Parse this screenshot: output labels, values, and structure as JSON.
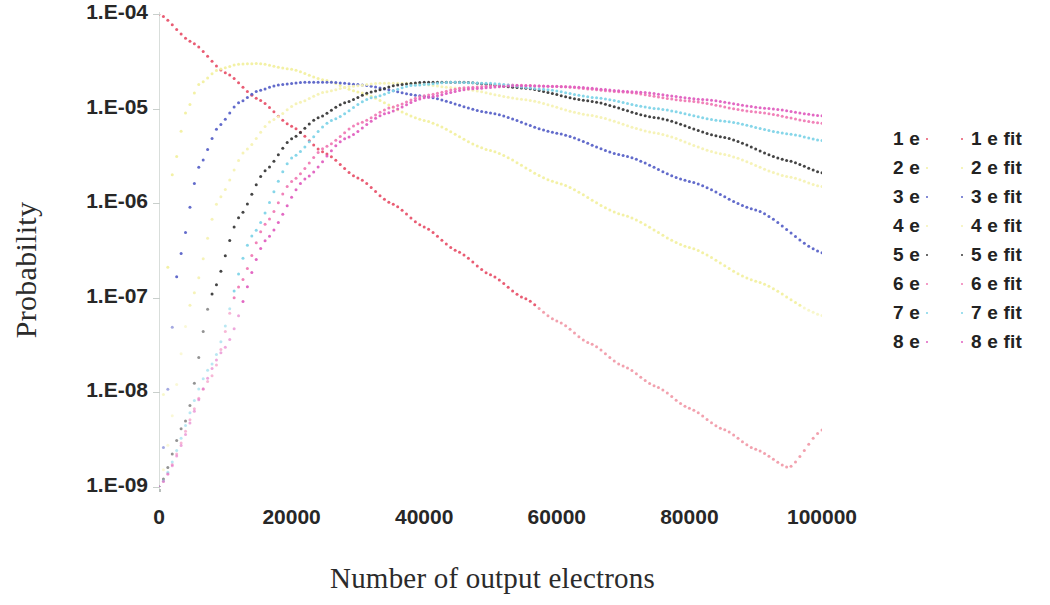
{
  "chart_data": {
    "type": "scatter",
    "title": "",
    "xlabel": "Number of output electrons",
    "ylabel": "Probability",
    "xlim": [
      0,
      100000
    ],
    "ylim": [
      1e-09,
      0.0001
    ],
    "yscale": "log",
    "xscale": "linear",
    "grid": false,
    "legend_position": "right",
    "x_tick_labels": [
      "0",
      "20000",
      "40000",
      "60000",
      "80000",
      "100000"
    ],
    "x_ticks": [
      0,
      20000,
      40000,
      60000,
      80000,
      100000
    ],
    "y_tick_labels": [
      "1.E-04",
      "1.E-05",
      "1.E-06",
      "1.E-07",
      "1.E-08",
      "1.E-09"
    ],
    "y_ticks": [
      0.0001,
      1e-05,
      1e-06,
      1e-07,
      1e-08,
      1e-09
    ],
    "legend_entries": [
      {
        "label": "1 e",
        "color": "#e8536b"
      },
      {
        "label": "2 e",
        "color": "#f2f0a0"
      },
      {
        "label": "3 e",
        "color": "#5a63c8"
      },
      {
        "label": "4 e",
        "color": "#f5f2b4"
      },
      {
        "label": "5 e",
        "color": "#3a3a3a"
      },
      {
        "label": "6 e",
        "color": "#f07bb5"
      },
      {
        "label": "7 e",
        "color": "#7fd4e8"
      },
      {
        "label": "8 e",
        "color": "#e060c0"
      }
    ],
    "legend_fit_entries": [
      {
        "label": "1 e fit",
        "color": "#e8536b"
      },
      {
        "label": "2 e fit",
        "color": "#f2f0a0"
      },
      {
        "label": "3 e fit",
        "color": "#5a63c8"
      },
      {
        "label": "4 e fit",
        "color": "#f5f2b4"
      },
      {
        "label": "5 e fit",
        "color": "#3a3a3a"
      },
      {
        "label": "6 e fit",
        "color": "#f07bb5"
      },
      {
        "label": "7 e fit",
        "color": "#7fd4e8"
      },
      {
        "label": "8 e fit",
        "color": "#e060c0"
      }
    ],
    "series": [
      {
        "name": "1 e",
        "color": "#e8536b",
        "style": "dotted",
        "peak_x": 0,
        "peak_y": 0.0001,
        "points": [
          [
            0,
            0.0001
          ],
          [
            5000,
            5e-05
          ],
          [
            10000,
            2.4e-05
          ],
          [
            15000,
            1.25e-05
          ],
          [
            20000,
            6.5e-06
          ],
          [
            25000,
            3.4e-06
          ],
          [
            30000,
            1.85e-06
          ],
          [
            35000,
            1e-06
          ],
          [
            40000,
            5.6e-07
          ],
          [
            45000,
            3.1e-07
          ],
          [
            50000,
            1.75e-07
          ],
          [
            55000,
            1e-07
          ],
          [
            60000,
            5.7e-08
          ],
          [
            65000,
            3.3e-08
          ],
          [
            70000,
            1.9e-08
          ],
          [
            75000,
            1.15e-08
          ],
          [
            80000,
            6.8e-09
          ],
          [
            85000,
            4.1e-09
          ],
          [
            90000,
            2.5e-09
          ],
          [
            95000,
            1.6e-09
          ],
          [
            100000,
            4e-09
          ]
        ]
      },
      {
        "name": "2 e",
        "color": "#f2f0a0",
        "style": "dotted",
        "peak_x": 14000,
        "peak_y": 3e-05,
        "points": [
          [
            0,
            1e-09
          ],
          [
            2000,
            2e-06
          ],
          [
            4000,
            9e-06
          ],
          [
            6000,
            1.8e-05
          ],
          [
            9000,
            2.6e-05
          ],
          [
            12000,
            2.95e-05
          ],
          [
            15000,
            3e-05
          ],
          [
            20000,
            2.6e-05
          ],
          [
            25000,
            2e-05
          ],
          [
            30000,
            1.5e-05
          ],
          [
            40000,
            7.5e-06
          ],
          [
            50000,
            3.6e-06
          ],
          [
            60000,
            1.65e-06
          ],
          [
            70000,
            7.5e-07
          ],
          [
            80000,
            3.4e-07
          ],
          [
            90000,
            1.5e-07
          ],
          [
            100000,
            6.5e-08
          ]
        ]
      },
      {
        "name": "3 e",
        "color": "#5a63c8",
        "style": "dotted",
        "peak_x": 24000,
        "peak_y": 1.9e-05,
        "points": [
          [
            0,
            1e-09
          ],
          [
            3000,
            2.5e-07
          ],
          [
            6000,
            2.4e-06
          ],
          [
            9000,
            6.5e-06
          ],
          [
            12000,
            1.15e-05
          ],
          [
            15000,
            1.55e-05
          ],
          [
            18000,
            1.78e-05
          ],
          [
            22000,
            1.9e-05
          ],
          [
            26000,
            1.9e-05
          ],
          [
            30000,
            1.8e-05
          ],
          [
            40000,
            1.35e-05
          ],
          [
            50000,
            9e-06
          ],
          [
            60000,
            5.5e-06
          ],
          [
            70000,
            3.2e-06
          ],
          [
            80000,
            1.7e-06
          ],
          [
            90000,
            8.5e-07
          ],
          [
            100000,
            3e-07
          ]
        ]
      },
      {
        "name": "4 e",
        "color": "#f5f2b4",
        "style": "dotted",
        "peak_x": 33000,
        "peak_y": 1.85e-05,
        "points": [
          [
            0,
            1e-09
          ],
          [
            5000,
            1e-07
          ],
          [
            9000,
            1.1e-06
          ],
          [
            13000,
            3.6e-06
          ],
          [
            17000,
            7.5e-06
          ],
          [
            21000,
            1.15e-05
          ],
          [
            25000,
            1.5e-05
          ],
          [
            29000,
            1.72e-05
          ],
          [
            33000,
            1.85e-05
          ],
          [
            38000,
            1.85e-05
          ],
          [
            45000,
            1.65e-05
          ],
          [
            55000,
            1.25e-05
          ],
          [
            65000,
            8.5e-06
          ],
          [
            75000,
            5.5e-06
          ],
          [
            85000,
            3.3e-06
          ],
          [
            95000,
            1.9e-06
          ],
          [
            100000,
            1.5e-06
          ]
        ]
      },
      {
        "name": "5 e",
        "color": "#3a3a3a",
        "style": "dotted",
        "peak_x": 38000,
        "peak_y": 1.9e-05,
        "points": [
          [
            0,
            1e-09
          ],
          [
            4000,
            5e-09
          ],
          [
            8000,
            1.1e-07
          ],
          [
            12000,
            7e-07
          ],
          [
            16000,
            2.2e-06
          ],
          [
            20000,
            4.8e-06
          ],
          [
            24000,
            8e-06
          ],
          [
            28000,
            1.15e-05
          ],
          [
            32000,
            1.5e-05
          ],
          [
            36000,
            1.78e-05
          ],
          [
            40000,
            1.9e-05
          ],
          [
            46000,
            1.9e-05
          ],
          [
            55000,
            1.65e-05
          ],
          [
            65000,
            1.2e-05
          ],
          [
            75000,
            8e-06
          ],
          [
            85000,
            5e-06
          ],
          [
            95000,
            2.8e-06
          ],
          [
            100000,
            2.1e-06
          ]
        ]
      },
      {
        "name": "6 e",
        "color": "#f07bb5",
        "style": "dotted",
        "peak_x": 46000,
        "peak_y": 1.75e-05,
        "points": [
          [
            0,
            1e-09
          ],
          [
            8000,
            1.5e-08
          ],
          [
            12000,
            1.3e-07
          ],
          [
            16000,
            6e-07
          ],
          [
            20000,
            1.7e-06
          ],
          [
            25000,
            3.9e-06
          ],
          [
            30000,
            6.9e-06
          ],
          [
            35000,
            1.03e-05
          ],
          [
            40000,
            1.37e-05
          ],
          [
            46000,
            1.66e-05
          ],
          [
            52000,
            1.78e-05
          ],
          [
            60000,
            1.72e-05
          ],
          [
            70000,
            1.5e-05
          ],
          [
            80000,
            1.2e-05
          ],
          [
            90000,
            9.2e-06
          ],
          [
            100000,
            7e-06
          ]
        ]
      },
      {
        "name": "7 e",
        "color": "#7fd4e8",
        "style": "dotted",
        "peak_x": 40000,
        "peak_y": 1.9e-05,
        "points": [
          [
            0,
            1e-09
          ],
          [
            8000,
            2e-08
          ],
          [
            14000,
            4.5e-07
          ],
          [
            20000,
            3e-06
          ],
          [
            26000,
            7.5e-06
          ],
          [
            32000,
            1.3e-05
          ],
          [
            38000,
            1.75e-05
          ],
          [
            44000,
            1.9e-05
          ],
          [
            50000,
            1.85e-05
          ],
          [
            58000,
            1.6e-05
          ],
          [
            66000,
            1.3e-05
          ],
          [
            75000,
            1e-05
          ],
          [
            85000,
            7.4e-06
          ],
          [
            95000,
            5.4e-06
          ],
          [
            100000,
            4.6e-06
          ]
        ]
      },
      {
        "name": "8 e",
        "color": "#e060c0",
        "style": "dotted",
        "peak_x": 50000,
        "peak_y": 1.75e-05,
        "points": [
          [
            0,
            1e-09
          ],
          [
            10000,
            3e-08
          ],
          [
            16000,
            4e-07
          ],
          [
            22000,
            1.8e-06
          ],
          [
            28000,
            4.8e-06
          ],
          [
            34000,
            8.8e-06
          ],
          [
            40000,
            1.3e-05
          ],
          [
            47000,
            1.62e-05
          ],
          [
            54000,
            1.75e-05
          ],
          [
            62000,
            1.7e-05
          ],
          [
            72000,
            1.5e-05
          ],
          [
            82000,
            1.25e-05
          ],
          [
            92000,
            1e-05
          ],
          [
            100000,
            8.4e-06
          ]
        ]
      }
    ]
  },
  "axes": {
    "y_title": "Probability",
    "x_title": "Number of output electrons"
  }
}
